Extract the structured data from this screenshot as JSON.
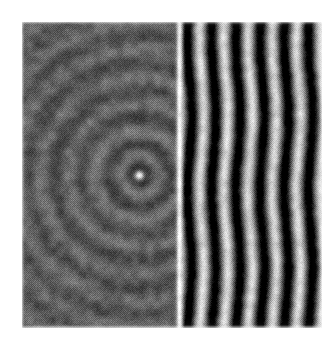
{
  "figure": {
    "title": "Optical interference pattern",
    "caption": "",
    "alt_text": "Grayscale photographic plate showing concentric circular interference fringes on the left half transitioning into straight vertical fringes on the right half, with a bright point source near the centre.",
    "media_type": "scanned-halftone-photograph",
    "background_color": "#ffffff"
  },
  "plate": {
    "label": "interference-plate",
    "x": 22,
    "y": 22,
    "width": 300,
    "height": 306,
    "mean_gray": "#5b5b5b",
    "halftone": true,
    "halftone_cell_px": 2,
    "noise_amount": 0.2
  },
  "chart_data": {
    "type": "heatmap",
    "title": "Optical interference pattern",
    "xlabel": "",
    "ylabel": "",
    "colormap": "grayscale",
    "value_range": [
      0,
      255
    ],
    "grid": false,
    "legend": "none",
    "image_width": 300,
    "image_height": 306,
    "regions": [
      {
        "name": "circular-fringe-region",
        "description": "Concentric circular interference rings around a point source",
        "x_start": 0,
        "x_end": 152,
        "center_x": 117,
        "center_y": 153,
        "ring_period_px": 27,
        "ring_phase": 0.35,
        "ring_amplitude": 26,
        "base_gray": 92,
        "radial_falloff": 210
      },
      {
        "name": "straight-fringe-region",
        "description": "Straight vertical Young-type fringes of high contrast",
        "x_start": 152,
        "x_end": 300,
        "fringe_period_px": 24.2,
        "fringe_phase_px": 155,
        "fringe_amplitude": 118,
        "base_gray": 96,
        "waviness_amplitude_px": 2.2,
        "waviness_period_px": 150
      },
      {
        "name": "transition-edge",
        "description": "Bright vertical boundary separating circular and straight fringe zones",
        "x": 157,
        "width": 7,
        "peak_gray": 248
      }
    ],
    "bright_fringe_x_positions": [
      157,
      180,
      205,
      229,
      253,
      277,
      300
    ],
    "point_source": {
      "name": "central-bright-spot",
      "x": 117,
      "y": 153,
      "radius_px": 5,
      "peak_gray": 255,
      "halo_radius_px": 13,
      "halo_gray": 38
    }
  }
}
